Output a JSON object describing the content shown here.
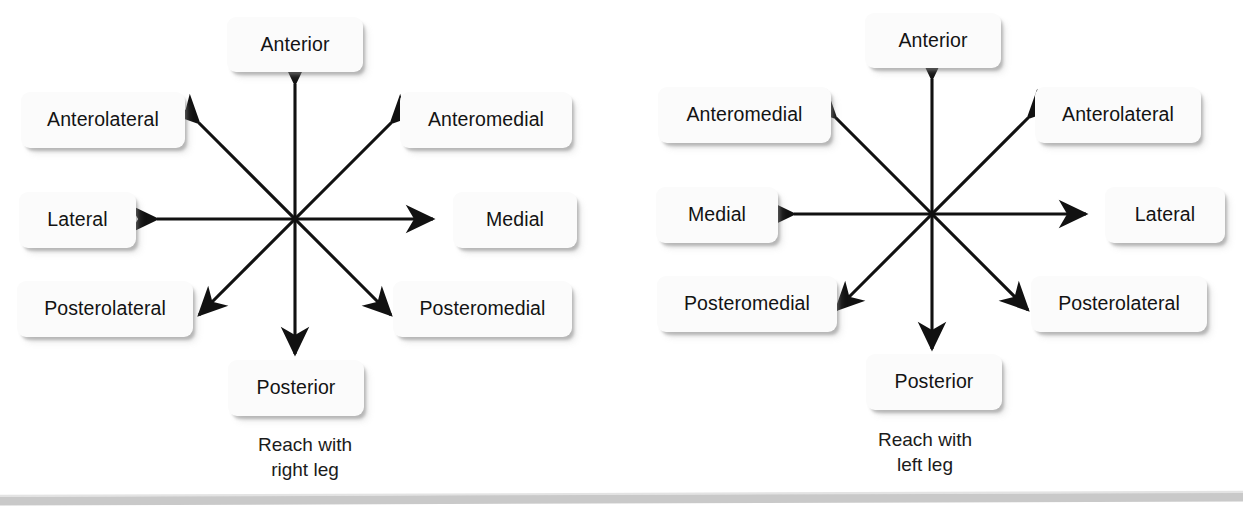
{
  "figure": {
    "type": "star-excursion-balance-test",
    "background_color": "#ffffff",
    "label_box_color": "#fbfbfb",
    "arrow_color": "#111111",
    "rule_color": "#c8c8c8"
  },
  "diagrams": [
    {
      "id": "right-leg",
      "caption": "Reach with\nright leg",
      "center": {
        "x": 295,
        "y": 219
      },
      "directions": [
        {
          "key": "anterior",
          "label": "Anterior",
          "angle_deg": 90
        },
        {
          "key": "anteromedial",
          "label": "Anteromedial",
          "angle_deg": 45
        },
        {
          "key": "medial",
          "label": "Medial",
          "angle_deg": 0
        },
        {
          "key": "posteromedial",
          "label": "Posteromedial",
          "angle_deg": -45
        },
        {
          "key": "posterior",
          "label": "Posterior",
          "angle_deg": -90
        },
        {
          "key": "posterolateral",
          "label": "Posterolateral",
          "angle_deg": -135
        },
        {
          "key": "lateral",
          "label": "Lateral",
          "angle_deg": 180
        },
        {
          "key": "anterolateral",
          "label": "Anterolateral",
          "angle_deg": 135
        }
      ],
      "boxes": {
        "anterior": {
          "x": 227,
          "y": 17,
          "w": 136,
          "h": 55
        },
        "anteromedial": {
          "x": 400,
          "y": 92,
          "w": 172,
          "h": 56
        },
        "medial": {
          "x": 453,
          "y": 192,
          "w": 124,
          "h": 56
        },
        "posteromedial": {
          "x": 393,
          "y": 281,
          "w": 179,
          "h": 56
        },
        "posterior": {
          "x": 228,
          "y": 360,
          "w": 136,
          "h": 56
        },
        "posterolateral": {
          "x": 17,
          "y": 281,
          "w": 176,
          "h": 56
        },
        "lateral": {
          "x": 19,
          "y": 192,
          "w": 117,
          "h": 56
        },
        "anterolateral": {
          "x": 21,
          "y": 92,
          "w": 164,
          "h": 56
        }
      },
      "caption_pos": {
        "x": 215,
        "y": 432,
        "w": 180
      }
    },
    {
      "id": "left-leg",
      "caption": "Reach with\nleft leg",
      "center": {
        "x": 312,
        "y": 214
      },
      "directions": [
        {
          "key": "anterior",
          "label": "Anterior",
          "angle_deg": 90
        },
        {
          "key": "anterolateral",
          "label": "Anterolateral",
          "angle_deg": 45
        },
        {
          "key": "lateral",
          "label": "Lateral",
          "angle_deg": 0
        },
        {
          "key": "posterolateral",
          "label": "Posterolateral",
          "angle_deg": -45
        },
        {
          "key": "posterior",
          "label": "Posterior",
          "angle_deg": -90
        },
        {
          "key": "posteromedial",
          "label": "Posteromedial",
          "angle_deg": -135
        },
        {
          "key": "medial",
          "label": "Medial",
          "angle_deg": 180
        },
        {
          "key": "anteromedial",
          "label": "Anteromedial",
          "angle_deg": 135
        }
      ],
      "boxes": {
        "anterior": {
          "x": 245,
          "y": 13,
          "w": 136,
          "h": 55
        },
        "anterolateral": {
          "x": 415,
          "y": 87,
          "w": 166,
          "h": 56
        },
        "lateral": {
          "x": 485,
          "y": 187,
          "w": 120,
          "h": 56
        },
        "posterolateral": {
          "x": 411,
          "y": 276,
          "w": 176,
          "h": 56
        },
        "posterior": {
          "x": 246,
          "y": 354,
          "w": 136,
          "h": 56
        },
        "posteromedial": {
          "x": 37,
          "y": 276,
          "w": 180,
          "h": 56
        },
        "medial": {
          "x": 36,
          "y": 187,
          "w": 122,
          "h": 56
        },
        "anteromedial": {
          "x": 38,
          "y": 87,
          "w": 173,
          "h": 56
        }
      },
      "caption_pos": {
        "x": 835,
        "y": 427,
        "w": 180
      }
    }
  ]
}
